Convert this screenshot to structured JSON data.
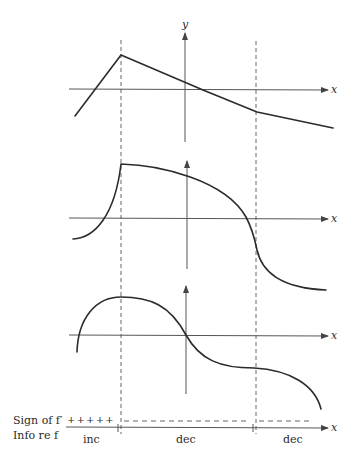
{
  "figure": {
    "axis_labels": {
      "y": "y",
      "x": "x"
    },
    "critical_points": [
      "left-dashed-line",
      "right-dashed-line"
    ],
    "graphs": [
      {
        "name": "piecewise-linear-f",
        "description": "increasing line to a corner, then decreasing with a second corner"
      },
      {
        "name": "cusp-curve-f",
        "description": "rises with vertical tangent to a corner, then decreases through a vertical tangent"
      },
      {
        "name": "smooth-curve-f",
        "description": "smooth max then decreasing with horizontal tangent inflection"
      }
    ],
    "sign_chart": {
      "sign_label": "Sign of f′",
      "info_label": "Info re f",
      "signs": [
        "+ + + + +",
        "– – – – – – – – – – – – –",
        "– – – – –"
      ],
      "intervals": [
        "inc",
        "dec",
        "dec"
      ]
    },
    "colors": {
      "ink": "#2b2b2b",
      "axis": "#555555",
      "background": "#ffffff"
    }
  }
}
